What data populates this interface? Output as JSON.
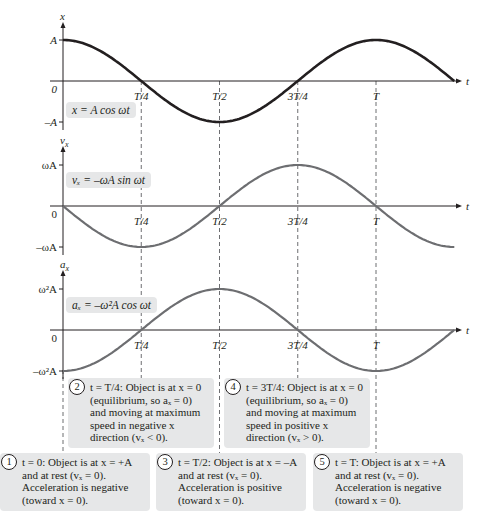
{
  "chart_data": [
    {
      "type": "line",
      "name": "position",
      "function": "x = A cos(ωt)",
      "equation_label": "x = A cos ωt",
      "ylabel": "x",
      "xlabel": "t",
      "y_ticks": [
        "A",
        "0",
        "–A"
      ],
      "y_tick_values": [
        1,
        0,
        -1
      ],
      "x_ticks": [
        "T/4",
        "T/2",
        "3T/4",
        "T"
      ],
      "x_tick_values": [
        0.25,
        0.5,
        0.75,
        1.0
      ],
      "x_range_periods": [
        0,
        1.25
      ],
      "ylim": [
        -1,
        1
      ],
      "color": "#231f20"
    },
    {
      "type": "line",
      "name": "velocity",
      "function": "v_x = -ωA sin(ωt)",
      "equation_label": "vx = –ωA sin ωt",
      "ylabel": "vx",
      "xlabel": "t",
      "y_ticks": [
        "ωA",
        "0",
        "–ωA"
      ],
      "y_tick_values": [
        1,
        0,
        -1
      ],
      "x_ticks": [
        "T/4",
        "T/2",
        "3T/4",
        "T"
      ],
      "x_tick_values": [
        0.25,
        0.5,
        0.75,
        1.0
      ],
      "x_range_periods": [
        0,
        1.25
      ],
      "ylim": [
        -1,
        1
      ],
      "color": "#6d6e71"
    },
    {
      "type": "line",
      "name": "acceleration",
      "function": "a_x = -ω²A cos(ωt)",
      "equation_label": "ax = –ω²A cos ωt",
      "ylabel": "ax",
      "xlabel": "t",
      "y_ticks": [
        "ω²A",
        "0",
        "–ω²A"
      ],
      "y_tick_values": [
        1,
        0,
        -1
      ],
      "x_ticks": [
        "T/4",
        "T/2",
        "3T/4",
        "T"
      ],
      "x_tick_values": [
        0.25,
        0.5,
        0.75,
        1.0
      ],
      "x_range_periods": [
        0,
        1.25
      ],
      "ylim": [
        -1,
        1
      ],
      "color": "#6d6e71"
    }
  ],
  "colors": {
    "axis": "#231f20",
    "position_curve": "#231f20",
    "other_curves": "#6d6e71",
    "box_bg": "#e6e7e8"
  },
  "plots": {
    "position": {
      "ylabel": "x",
      "xlabel": "t",
      "ticks": {
        "top": "A",
        "zero": "0",
        "bottom": "–A"
      },
      "eq": "x = A cos ωt"
    },
    "velocity": {
      "ylabel": "v",
      "ylabel_sub": "x",
      "xlabel": "t",
      "ticks": {
        "top": "ωA",
        "zero": "0",
        "bottom": "–ωA"
      },
      "eq": "vₓ = –ωA sin ωt"
    },
    "acceleration": {
      "ylabel": "a",
      "ylabel_sub": "x",
      "xlabel": "t",
      "ticks": {
        "top": "ω²A",
        "zero": "0",
        "bottom": "–ω²A"
      },
      "eq": "aₓ = –ω²A cos ωt"
    }
  },
  "x_ticks": [
    "T/4",
    "T/2",
    "3T/4",
    "T"
  ],
  "notes": [
    {
      "num": "1",
      "text": "t = 0: Object is at x = +A\nand at rest (vₓ = 0).\nAcceleration is negative\n(toward x = 0)."
    },
    {
      "num": "2",
      "text": "t = T/4: Object is at x = 0\n(equilibrium, so aₓ = 0)\nand moving at maximum\nspeed in negative x\ndirection (vₓ < 0)."
    },
    {
      "num": "3",
      "text": "t = T/2: Object is at x = –A\nand at rest (vₓ = 0).\nAcceleration is positive\n(toward x = 0)."
    },
    {
      "num": "4",
      "text": "t = 3T/4: Object is at x = 0\n(equilibrium, so aₓ = 0)\nand moving at maximum\nspeed in positive x\ndirection (vₓ > 0)."
    },
    {
      "num": "5",
      "text": "t = T: Object is at x = +A\nand at rest (vₓ = 0).\nAcceleration is negative\n(toward x = 0)."
    }
  ]
}
